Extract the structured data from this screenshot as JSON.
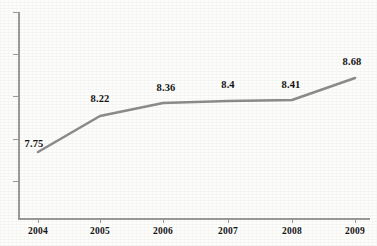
{
  "chart_data": {
    "type": "line",
    "title": "",
    "subtitle": "",
    "xlabel": "",
    "ylabel": "",
    "categories": [
      "2004",
      "2005",
      "2006",
      "2007",
      "2008",
      "2009"
    ],
    "values": [
      7.75,
      8.22,
      8.36,
      8.4,
      8.41,
      8.68
    ],
    "data_labels": [
      "7.75",
      "8.22",
      "8.36",
      "8.4",
      "8.41",
      "8.68"
    ],
    "series": [
      {
        "name": "",
        "values": [
          7.75,
          8.22,
          8.36,
          8.4,
          8.41,
          8.68
        ],
        "color": "#8c8c8c",
        "marker": "none",
        "line_width": 2.5
      }
    ],
    "ylim": [
      7.4,
      8.95
    ],
    "xlim": [
      "2004",
      "2009"
    ],
    "y_tick_labels": [],
    "y_tick_count": 5,
    "x_tick_labels": [
      "2004",
      "2005",
      "2006",
      "2007",
      "2008",
      "2009"
    ],
    "grid": false,
    "legend": false,
    "legend_position": "none",
    "axis_color": "#9a9a9a",
    "label_color": "#141414",
    "background_color": "#fdfdfc",
    "annotations": []
  },
  "axis": {
    "y_ticks": [
      {
        "top": 12
      },
      {
        "top": 54
      },
      {
        "top": 96
      },
      {
        "top": 139
      },
      {
        "top": 181
      }
    ],
    "x_ticks": [
      {
        "left": 38
      },
      {
        "left": 100
      },
      {
        "left": 163
      },
      {
        "left": 228
      },
      {
        "left": 292
      },
      {
        "left": 355
      }
    ]
  },
  "points": [
    {
      "label": "7.75",
      "x": 38,
      "y": 152,
      "label_x": 34,
      "label_y": 138,
      "cat": "2004",
      "cat_x": 38
    },
    {
      "label": "8.22",
      "x": 100,
      "y": 116,
      "label_x": 100,
      "label_y": 93,
      "cat": "2005",
      "cat_x": 100
    },
    {
      "label": "8.36",
      "x": 163,
      "y": 103,
      "label_x": 166,
      "label_y": 82,
      "cat": "2006",
      "cat_x": 163
    },
    {
      "label": "8.4",
      "x": 228,
      "y": 101,
      "label_x": 228,
      "label_y": 79,
      "cat": "2007",
      "cat_x": 228
    },
    {
      "label": "8.41",
      "x": 292,
      "y": 100,
      "label_x": 291,
      "label_y": 79,
      "cat": "2008",
      "cat_x": 292
    },
    {
      "label": "8.68",
      "x": 355,
      "y": 78,
      "label_x": 352,
      "label_y": 56,
      "cat": "2009",
      "cat_x": 355
    }
  ],
  "line": {
    "path": "M 38 152 L 100 116 L 163 103 L 228 101 L 292 100 L 355 78",
    "color": "#8c8c8c",
    "width": 2.6
  }
}
